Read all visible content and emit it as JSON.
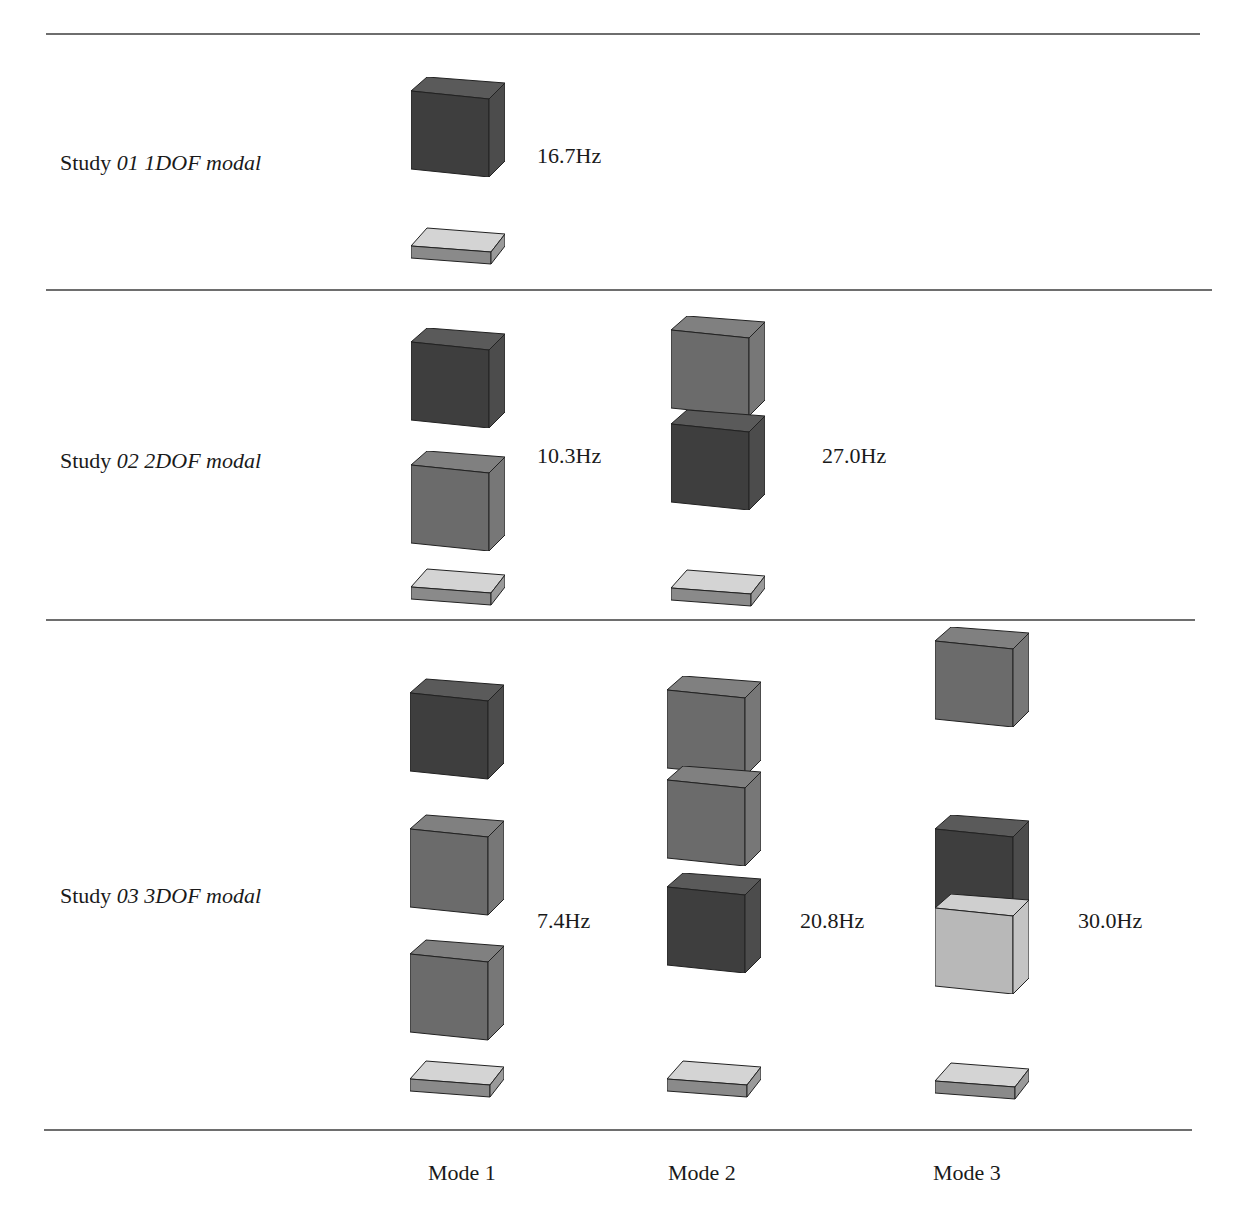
{
  "table": {
    "rows": [
      {
        "study_prefix": "Study ",
        "study_name": "01 1DOF modal",
        "modes": [
          {
            "frequency": "16.7Hz"
          }
        ]
      },
      {
        "study_prefix": "Study ",
        "study_name": "02 2DOF modal",
        "modes": [
          {
            "frequency": "10.3Hz"
          },
          {
            "frequency": "27.0Hz"
          }
        ]
      },
      {
        "study_prefix": "Study ",
        "study_name": "03 3DOF modal",
        "modes": [
          {
            "frequency": "7.4Hz"
          },
          {
            "frequency": "20.8Hz"
          },
          {
            "frequency": "30.0Hz"
          }
        ]
      }
    ],
    "footer": {
      "mode_labels": [
        "Mode 1",
        "Mode 2",
        "Mode 3"
      ]
    }
  },
  "colors": {
    "cube_dark": "#3e3e3e",
    "cube_mid": "#6b6b6b",
    "cube_light": "#b8b8b8",
    "plate_top": "#d4d4d4",
    "plate_side": "#8a8a8a",
    "rule": "#6e6e6e"
  }
}
